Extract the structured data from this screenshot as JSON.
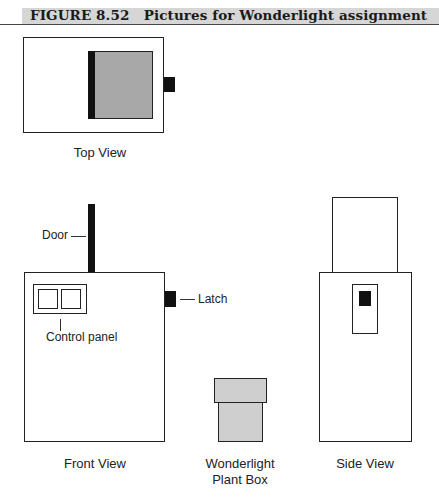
{
  "figure": {
    "number": "FIGURE 8.52",
    "title": "Pictures for Wonderlight assignment"
  },
  "views": {
    "top": {
      "label": "Top View"
    },
    "front": {
      "label": "Front View",
      "callouts": {
        "door": "Door",
        "latch": "Latch",
        "control_panel": "Control panel"
      }
    },
    "plant_box": {
      "label_line1": "Wonderlight",
      "label_line2": "Plant Box"
    },
    "side": {
      "label": "Side View"
    }
  },
  "colors": {
    "outline": "#222222",
    "dark_fill": "#111111",
    "gray_fill": "#a8a8a8",
    "light_gray_fill": "#cfcfcf",
    "caption_bar": "#d6d6d6"
  }
}
